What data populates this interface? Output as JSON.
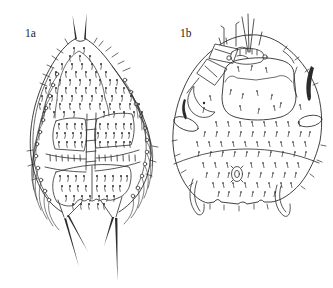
{
  "figure": {
    "background_color": "#ffffff",
    "ink_color": "#2b2b2b",
    "label_color": "#1c1c1c",
    "panels": [
      {
        "label": "1a"
      },
      {
        "label": "1b"
      }
    ]
  }
}
